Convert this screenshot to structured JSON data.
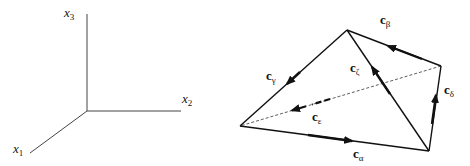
{
  "axes_figure": {
    "axes": [
      {
        "id": "x1",
        "name": "x",
        "sub": "1"
      },
      {
        "id": "x2",
        "name": "x",
        "sub": "2"
      },
      {
        "id": "x3",
        "name": "x",
        "sub": "3"
      }
    ]
  },
  "tetrahedron_figure": {
    "edges": [
      {
        "id": "alpha",
        "name": "c",
        "sub": "α",
        "style": "solid",
        "arrow": "toward-bottom-right"
      },
      {
        "id": "beta",
        "name": "c",
        "sub": "β",
        "style": "solid",
        "arrow": "toward-top"
      },
      {
        "id": "gamma",
        "name": "c",
        "sub": "γ",
        "style": "solid",
        "arrow": "toward-left"
      },
      {
        "id": "delta",
        "name": "c",
        "sub": "δ",
        "style": "solid",
        "arrow": "toward-right"
      },
      {
        "id": "epsilon",
        "name": "c",
        "sub": "ε",
        "style": "dashed",
        "arrow": "toward-left"
      },
      {
        "id": "zeta",
        "name": "c",
        "sub": "ζ",
        "style": "solid",
        "arrow": "toward-top"
      }
    ]
  }
}
